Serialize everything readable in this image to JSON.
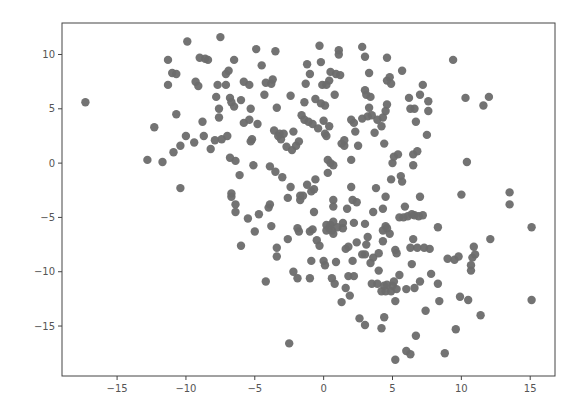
{
  "chart_data": {
    "type": "scatter",
    "title": "",
    "xlabel": "",
    "ylabel": "",
    "xlim": [
      -19.0,
      16.8
    ],
    "ylim": [
      -19.6,
      12.9
    ],
    "grid": false,
    "legend": null,
    "xticks": [
      -15,
      -10,
      -5,
      0,
      5,
      10,
      15
    ],
    "xtick_labels": [
      "−15",
      "−10",
      "−5",
      "0",
      "5",
      "10",
      "15"
    ],
    "yticks": [
      10,
      5,
      0,
      -5,
      -10,
      -15
    ],
    "ytick_labels": [
      "10",
      "5",
      "0",
      "−5",
      "−10",
      "−15"
    ],
    "marker_color": "#6b6b6b",
    "series": [
      {
        "name": "points",
        "points": [
          [
            -17.3,
            5.6
          ],
          [
            -12.8,
            0.3
          ],
          [
            -12.3,
            3.3
          ],
          [
            -11.7,
            0.1
          ],
          [
            -11.3,
            9.5
          ],
          [
            -11.3,
            7.2
          ],
          [
            -11.0,
            8.3
          ],
          [
            -10.9,
            1.0
          ],
          [
            -10.7,
            8.2
          ],
          [
            -10.7,
            4.5
          ],
          [
            -10.4,
            1.6
          ],
          [
            -10.4,
            -2.3
          ],
          [
            -10.0,
            2.5
          ],
          [
            -9.9,
            11.2
          ],
          [
            -9.4,
            1.9
          ],
          [
            -9.3,
            7.5
          ],
          [
            -9.1,
            7.1
          ],
          [
            -9.0,
            9.7
          ],
          [
            -8.8,
            3.8
          ],
          [
            -8.7,
            2.5
          ],
          [
            -8.6,
            9.6
          ],
          [
            -8.4,
            9.5
          ],
          [
            -8.2,
            1.3
          ],
          [
            -7.9,
            2.1
          ],
          [
            -7.8,
            6.1
          ],
          [
            -7.7,
            7.2
          ],
          [
            -7.6,
            5.0
          ],
          [
            -7.6,
            4.2
          ],
          [
            -7.5,
            11.6
          ],
          [
            -7.4,
            2.2
          ],
          [
            -7.1,
            7.2
          ],
          [
            -7.1,
            8.2
          ],
          [
            -7.0,
            2.5
          ],
          [
            -6.9,
            8.5
          ],
          [
            -6.8,
            0.5
          ],
          [
            -6.8,
            6.0
          ],
          [
            -6.7,
            5.6
          ],
          [
            -6.7,
            -2.8
          ],
          [
            -6.7,
            -3.1
          ],
          [
            -6.5,
            9.5
          ],
          [
            -6.5,
            5.2
          ],
          [
            -6.4,
            0.2
          ],
          [
            -6.4,
            -3.8
          ],
          [
            -6.4,
            -4.5
          ],
          [
            -6.1,
            -1.1
          ],
          [
            -6.0,
            5.8
          ],
          [
            -6.0,
            -7.6
          ],
          [
            -5.8,
            7.5
          ],
          [
            -5.8,
            3.7
          ],
          [
            -5.5,
            -5.1
          ],
          [
            -5.4,
            7.2
          ],
          [
            -5.4,
            4.0
          ],
          [
            -5.3,
            2.0
          ],
          [
            -5.3,
            5.0
          ],
          [
            -5.2,
            2.2
          ],
          [
            -5.1,
            -0.2
          ],
          [
            -5.0,
            -6.3
          ],
          [
            -4.9,
            10.5
          ],
          [
            -4.8,
            3.6
          ],
          [
            -4.7,
            -4.7
          ],
          [
            -4.5,
            9.0
          ],
          [
            -4.3,
            6.3
          ],
          [
            -4.2,
            7.4
          ],
          [
            -4.2,
            -10.9
          ],
          [
            -4.0,
            -4.1
          ],
          [
            -3.9,
            -0.3
          ],
          [
            -3.9,
            -3.8
          ],
          [
            -3.8,
            7.3
          ],
          [
            -3.8,
            -5.8
          ],
          [
            -3.7,
            7.7
          ],
          [
            -3.6,
            3.0
          ],
          [
            -3.5,
            -0.8
          ],
          [
            -3.5,
            10.3
          ],
          [
            -3.4,
            5.1
          ],
          [
            -3.4,
            -7.8
          ],
          [
            -3.4,
            -8.6
          ],
          [
            -3.3,
            2.5
          ],
          [
            -3.2,
            2.7
          ],
          [
            -3.1,
            2.2
          ],
          [
            -3.0,
            -1.3
          ],
          [
            -2.9,
            2.7
          ],
          [
            -2.7,
            1.5
          ],
          [
            -2.6,
            -7.0
          ],
          [
            -2.6,
            -3.2
          ],
          [
            -2.5,
            -16.6
          ],
          [
            -2.4,
            -2.2
          ],
          [
            -2.4,
            6.2
          ],
          [
            -2.3,
            1.2
          ],
          [
            -2.2,
            2.9
          ],
          [
            -2.2,
            -10.0
          ],
          [
            -2.0,
            1.6
          ],
          [
            -1.9,
            -10.6
          ],
          [
            -1.9,
            -6.0
          ],
          [
            -1.8,
            2.0
          ],
          [
            -1.8,
            -6.3
          ],
          [
            -1.7,
            -3.0
          ],
          [
            -1.7,
            -3.4
          ],
          [
            -1.6,
            4.4
          ],
          [
            -1.5,
            -3.0
          ],
          [
            -1.4,
            4.0
          ],
          [
            -1.4,
            5.6
          ],
          [
            -1.3,
            7.3
          ],
          [
            -1.2,
            9.1
          ],
          [
            -1.2,
            -2.0
          ],
          [
            -1.1,
            3.8
          ],
          [
            -1.0,
            -6.3
          ],
          [
            -1.0,
            8.2
          ],
          [
            -1.0,
            -10.6
          ],
          [
            -0.9,
            -2.6
          ],
          [
            -0.9,
            -9.0
          ],
          [
            -0.8,
            3.6
          ],
          [
            -0.8,
            -6.1
          ],
          [
            -0.7,
            -4.5
          ],
          [
            -0.7,
            -2.4
          ],
          [
            -0.6,
            5.9
          ],
          [
            -0.6,
            -1.5
          ],
          [
            -0.5,
            -7.1
          ],
          [
            -0.4,
            3.2
          ],
          [
            -0.3,
            -7.6
          ],
          [
            -0.3,
            10.8
          ],
          [
            -0.2,
            9.3
          ],
          [
            -0.2,
            5.5
          ],
          [
            -0.1,
            7.2
          ],
          [
            0.0,
            3.9
          ],
          [
            0.0,
            -9.0
          ],
          [
            0.1,
            2.7
          ],
          [
            0.1,
            -9.4
          ],
          [
            0.1,
            5.3
          ],
          [
            0.2,
            7.2
          ],
          [
            0.2,
            -5.7
          ],
          [
            0.2,
            -6.2
          ],
          [
            0.2,
            2.5
          ],
          [
            0.3,
            0.3
          ],
          [
            0.3,
            -0.9
          ],
          [
            0.4,
            3.4
          ],
          [
            0.4,
            -6.0
          ],
          [
            0.4,
            7.6
          ],
          [
            0.5,
            0.0
          ],
          [
            0.5,
            8.4
          ],
          [
            0.5,
            -5.7
          ],
          [
            0.6,
            -10.6
          ],
          [
            0.6,
            -6.2
          ],
          [
            0.7,
            -5.4
          ],
          [
            0.7,
            -6.5
          ],
          [
            0.7,
            -0.2
          ],
          [
            0.7,
            -3.4
          ],
          [
            0.7,
            -4.0
          ],
          [
            0.8,
            -11.1
          ],
          [
            0.8,
            6.3
          ],
          [
            0.9,
            -9.1
          ],
          [
            0.9,
            8.2
          ],
          [
            1.0,
            -5.9
          ],
          [
            1.1,
            10.4
          ],
          [
            1.1,
            10.0
          ],
          [
            1.2,
            8.1
          ],
          [
            1.3,
            -12.8
          ],
          [
            1.3,
            1.8
          ],
          [
            1.4,
            -6.0
          ],
          [
            1.4,
            -5.5
          ],
          [
            1.5,
            1.6
          ],
          [
            1.5,
            2.1
          ],
          [
            1.6,
            -7.9
          ],
          [
            1.6,
            -11.5
          ],
          [
            1.7,
            -4.2
          ],
          [
            1.8,
            -7.7
          ],
          [
            1.8,
            -10.4
          ],
          [
            1.9,
            -12.2
          ],
          [
            2.0,
            -2.2
          ],
          [
            2.0,
            0.3
          ],
          [
            2.0,
            4.0
          ],
          [
            2.1,
            -3.4
          ],
          [
            2.1,
            -9.0
          ],
          [
            2.2,
            3.7
          ],
          [
            2.2,
            -10.4
          ],
          [
            2.2,
            -5.5
          ],
          [
            2.3,
            2.9
          ],
          [
            2.4,
            -3.6
          ],
          [
            2.4,
            -7.3
          ],
          [
            2.5,
            1.6
          ],
          [
            2.6,
            -14.3
          ],
          [
            2.8,
            10.7
          ],
          [
            2.8,
            4.1
          ],
          [
            2.8,
            -8.4
          ],
          [
            3.0,
            -5.6
          ],
          [
            3.0,
            -8.4
          ],
          [
            3.0,
            -14.9
          ],
          [
            3.0,
            9.8
          ],
          [
            3.0,
            6.7
          ],
          [
            3.1,
            -7.5
          ],
          [
            3.1,
            6.3
          ],
          [
            3.2,
            -6.8
          ],
          [
            3.2,
            4.3
          ],
          [
            3.3,
            8.3
          ],
          [
            3.3,
            5.1
          ],
          [
            3.4,
            6.1
          ],
          [
            3.4,
            -9.2
          ],
          [
            3.5,
            -11.1
          ],
          [
            3.5,
            4.4
          ],
          [
            3.6,
            -8.7
          ],
          [
            3.6,
            -4.5
          ],
          [
            3.7,
            2.8
          ],
          [
            3.8,
            -2.3
          ],
          [
            3.9,
            4.0
          ],
          [
            3.9,
            -11.1
          ],
          [
            4.0,
            -9.9
          ],
          [
            4.0,
            -8.3
          ],
          [
            4.2,
            3.4
          ],
          [
            4.2,
            -15.2
          ],
          [
            4.2,
            -11.8
          ],
          [
            4.3,
            4.2
          ],
          [
            4.3,
            -7.2
          ],
          [
            4.3,
            -4.2
          ],
          [
            4.3,
            -6.2
          ],
          [
            4.4,
            -11.3
          ],
          [
            4.4,
            -14.2
          ],
          [
            4.4,
            1.8
          ],
          [
            4.5,
            -11.8
          ],
          [
            4.5,
            -3.1
          ],
          [
            4.5,
            -5.8
          ],
          [
            4.5,
            4.8
          ],
          [
            4.6,
            -6.0
          ],
          [
            4.6,
            7.6
          ],
          [
            4.6,
            5.4
          ],
          [
            4.6,
            9.7
          ],
          [
            4.6,
            -11.2
          ],
          [
            4.8,
            -6.5
          ],
          [
            4.8,
            7.9
          ],
          [
            4.9,
            -11.8
          ],
          [
            4.9,
            -1.5
          ],
          [
            4.9,
            7.3
          ],
          [
            5.0,
            -11.3
          ],
          [
            5.0,
            0.0
          ],
          [
            5.1,
            -10.9
          ],
          [
            5.1,
            0.6
          ],
          [
            5.2,
            -18.1
          ],
          [
            5.2,
            -12.7
          ],
          [
            5.2,
            -8.0
          ],
          [
            5.3,
            -8.3
          ],
          [
            5.3,
            -11.6
          ],
          [
            5.4,
            0.8
          ],
          [
            5.5,
            -10.3
          ],
          [
            5.5,
            -5.0
          ],
          [
            5.6,
            -1.2
          ],
          [
            5.7,
            8.5
          ],
          [
            5.7,
            -1.7
          ],
          [
            5.8,
            -5.0
          ],
          [
            5.9,
            -4.0
          ],
          [
            6.0,
            -11.6
          ],
          [
            6.0,
            -17.3
          ],
          [
            6.1,
            -4.9
          ],
          [
            6.2,
            6.0
          ],
          [
            6.3,
            -17.6
          ],
          [
            6.3,
            5.0
          ],
          [
            6.3,
            -7.8
          ],
          [
            6.4,
            -4.7
          ],
          [
            6.4,
            -9.3
          ],
          [
            6.5,
            0.8
          ],
          [
            6.5,
            -7.0
          ],
          [
            6.5,
            -0.2
          ],
          [
            6.6,
            -4.8
          ],
          [
            6.6,
            5.0
          ],
          [
            6.6,
            -11.5
          ],
          [
            6.7,
            -15.9
          ],
          [
            6.7,
            3.8
          ],
          [
            6.8,
            -7.8
          ],
          [
            6.8,
            1.1
          ],
          [
            6.9,
            -4.9
          ],
          [
            7.0,
            6.3
          ],
          [
            7.0,
            -3.1
          ],
          [
            7.0,
            -10.9
          ],
          [
            7.2,
            7.2
          ],
          [
            7.2,
            -4.8
          ],
          [
            7.3,
            -7.8
          ],
          [
            7.4,
            -13.6
          ],
          [
            7.5,
            2.6
          ],
          [
            7.6,
            4.8
          ],
          [
            7.6,
            5.7
          ],
          [
            7.7,
            -7.9
          ],
          [
            7.8,
            -10.2
          ],
          [
            8.3,
            -11.1
          ],
          [
            8.3,
            -5.9
          ],
          [
            8.4,
            -12.7
          ],
          [
            8.8,
            -17.5
          ],
          [
            9.0,
            -8.8
          ],
          [
            9.4,
            9.5
          ],
          [
            9.5,
            -8.9
          ],
          [
            9.6,
            -15.3
          ],
          [
            9.8,
            -8.6
          ],
          [
            9.9,
            -12.3
          ],
          [
            10.0,
            -2.9
          ],
          [
            10.3,
            6.0
          ],
          [
            10.4,
            0.1
          ],
          [
            10.5,
            -12.6
          ],
          [
            10.7,
            -9.4
          ],
          [
            10.7,
            -9.9
          ],
          [
            10.8,
            -8.7
          ],
          [
            10.9,
            -7.7
          ],
          [
            11.0,
            -8.4
          ],
          [
            11.4,
            -14.0
          ],
          [
            11.6,
            5.3
          ],
          [
            12.0,
            6.1
          ],
          [
            12.1,
            -7.0
          ],
          [
            13.5,
            -2.7
          ],
          [
            13.5,
            -3.8
          ],
          [
            15.1,
            -5.9
          ],
          [
            15.1,
            -12.6
          ]
        ]
      }
    ]
  }
}
